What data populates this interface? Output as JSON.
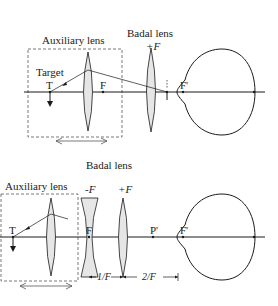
{
  "top_panel": {
    "auxiliary_label": "Auxiliary lens",
    "badal_label": "Badal lens",
    "badal_power": "+F",
    "target_label": "Target",
    "target_point": "T",
    "focal_point": "F",
    "eye_focal_point": "F'"
  },
  "bottom_panel": {
    "badal_label": "Badal lens",
    "auxiliary_label": "Auxiliary lens",
    "neg_lens_power": "-F",
    "pos_lens_power": "+F",
    "target_point": "T",
    "focal_point": "F",
    "principal_point": "P'",
    "eye_focal_point": "F'",
    "dist_1": "1/F",
    "dist_2": "2/F"
  },
  "colors": {
    "line": "#1a1a1a",
    "lens_fill": "#e6e6e6",
    "dash": "#555555"
  }
}
